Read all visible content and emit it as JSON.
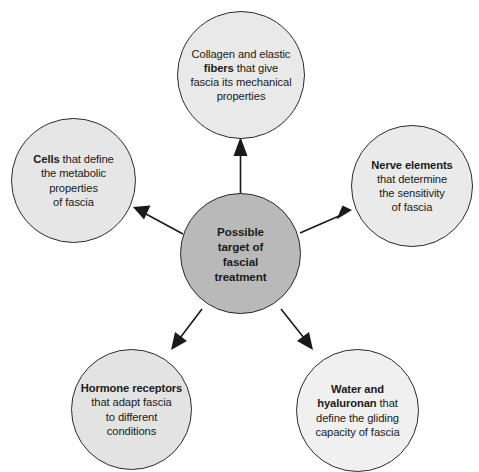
{
  "diagram": {
    "type": "radial-hub-and-spoke",
    "center": {
      "id": "center",
      "label_plain": "Possible target of fascial treatment",
      "lines": [
        "Possible",
        "target of",
        "fascial",
        "treatment"
      ],
      "fill": "#b9b9b9",
      "stroke": "#2b2b2b"
    },
    "nodes": [
      {
        "id": "fibers",
        "position": "top",
        "bold_text": "fibers",
        "label_plain": "Collagen and elastic fibers that give fascia its mechanical properties",
        "lines": [
          {
            "pre": "Collagen and elastic",
            "bold": "",
            "post": ""
          },
          {
            "pre": "",
            "bold": "fibers",
            "post": " that give"
          },
          {
            "pre": "fascia its mechanical",
            "bold": "",
            "post": ""
          },
          {
            "pre": "properties",
            "bold": "",
            "post": ""
          }
        ],
        "fill": "#e9e9e9",
        "stroke": "#2b2b2b"
      },
      {
        "id": "cells",
        "position": "left",
        "bold_text": "Cells",
        "label_plain": "Cells that define the metabolic properties of fascia",
        "lines": [
          {
            "pre": "",
            "bold": "Cells",
            "post": " that define"
          },
          {
            "pre": "the metabolic",
            "bold": "",
            "post": ""
          },
          {
            "pre": "properties",
            "bold": "",
            "post": ""
          },
          {
            "pre": "of fascia",
            "bold": "",
            "post": ""
          }
        ],
        "fill": "#e6e6e6",
        "stroke": "#2b2b2b"
      },
      {
        "id": "nerve",
        "position": "right",
        "bold_text": "Nerve elements",
        "label_plain": "Nerve elements that determine the sensitivity of fascia",
        "lines": [
          {
            "pre": "",
            "bold": "Nerve elements",
            "post": ""
          },
          {
            "pre": "that determine",
            "bold": "",
            "post": ""
          },
          {
            "pre": "the sensitivity",
            "bold": "",
            "post": ""
          },
          {
            "pre": "of fascia",
            "bold": "",
            "post": ""
          }
        ],
        "fill": "#eaeaea",
        "stroke": "#2b2b2b"
      },
      {
        "id": "hormone",
        "position": "bottom-left",
        "bold_text": "Hormone receptors",
        "label_plain": "Hormone receptors that adapt fascia to different conditions",
        "lines": [
          {
            "pre": "",
            "bold": "Hormone receptors",
            "post": ""
          },
          {
            "pre": "that adapt fascia",
            "bold": "",
            "post": ""
          },
          {
            "pre": "to different",
            "bold": "",
            "post": ""
          },
          {
            "pre": "conditions",
            "bold": "",
            "post": ""
          }
        ],
        "fill": "#e3e3e3",
        "stroke": "#2b2b2b"
      },
      {
        "id": "water",
        "position": "bottom-right",
        "bold_text": "Water and hyaluronan",
        "label_plain": "Water and hyaluronan that define the gliding capacity of fascia",
        "lines": [
          {
            "pre": "",
            "bold": "Water and",
            "post": ""
          },
          {
            "pre": "",
            "bold": "hyaluronan",
            "post": " that"
          },
          {
            "pre": "define the gliding",
            "bold": "",
            "post": ""
          },
          {
            "pre": "capacity of fascia",
            "bold": "",
            "post": ""
          }
        ],
        "fill": "#f0f0f0",
        "stroke": "#2b2b2b"
      }
    ],
    "arrows": [
      {
        "id": "arrow-to-fibers",
        "from": "center",
        "to": "fibers",
        "direction": "up"
      },
      {
        "id": "arrow-to-cells",
        "from": "center",
        "to": "cells",
        "direction": "up-left"
      },
      {
        "id": "arrow-to-nerve",
        "from": "center",
        "to": "nerve",
        "direction": "up-right"
      },
      {
        "id": "arrow-to-hormone",
        "from": "center",
        "to": "hormone",
        "direction": "down-left"
      },
      {
        "id": "arrow-to-water",
        "from": "center",
        "to": "water",
        "direction": "down-right"
      }
    ],
    "colors": {
      "background": "#ffffff",
      "arrow": "#1a1a1a",
      "text": "#1a1a1a"
    }
  }
}
